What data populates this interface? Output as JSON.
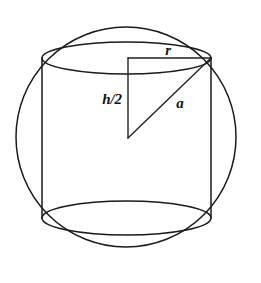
{
  "figure": {
    "background_color": "#ffffff",
    "ink_color": "#1a1a1a",
    "width": 261,
    "height": 283
  },
  "sphere": {
    "name": "sphere-outline",
    "shape": "circle",
    "center_x": 126,
    "center_y": 137,
    "radius": 110
  },
  "cylinder": {
    "name": "inscribed-cylinder",
    "left_x": 42,
    "right_x": 211,
    "top_center_y": 58,
    "bottom_center_y": 218,
    "ellipse_rx": 84.5,
    "top_ellipse_ry": 16,
    "bottom_ellipse_ry": 17
  },
  "triangle": {
    "name": "right-triangle",
    "apex_top_left_x": 128,
    "apex_top_left_y": 58,
    "apex_top_right_x": 211,
    "apex_top_right_y": 58,
    "apex_center_x": 128,
    "apex_center_y": 138
  },
  "labels": {
    "radius": {
      "text": "r",
      "x": 168,
      "y": 50
    },
    "half_height": {
      "text": "h/2",
      "x": 112,
      "y": 99
    },
    "slant": {
      "text": "a",
      "x": 180,
      "y": 103
    }
  },
  "artifacts": {
    "bottom_smudge": "",
    "top_smudge": ""
  }
}
